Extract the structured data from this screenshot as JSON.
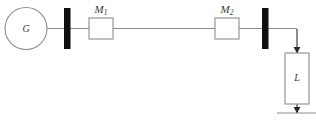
{
  "diagram": {
    "type": "single-line-power-system-schematic",
    "generator": {
      "label": "G",
      "shape": "circle",
      "cx": 26,
      "cy": 28.5,
      "r": 21
    },
    "busbars": [
      {
        "name": "bus-1",
        "x": 64,
        "y": 8,
        "width": 6.5,
        "height": 41
      },
      {
        "name": "bus-2",
        "x": 262,
        "y": 8,
        "width": 6.5,
        "height": 41
      }
    ],
    "machines": [
      {
        "label": "M",
        "subscript": "1",
        "label_full": "M1",
        "x": 89,
        "y": 18,
        "width": 24,
        "height": 21
      },
      {
        "label": "M",
        "subscript": "2",
        "label_full": "M2",
        "x": 215,
        "y": 18,
        "width": 24,
        "height": 21
      }
    ],
    "load": {
      "label": "L",
      "x": 285,
      "y": 53,
      "width": 24,
      "height": 51
    },
    "ground": {
      "name": "ground-symbol",
      "x1": 277,
      "x2": 316,
      "y": 113
    },
    "main_line_y": 28.5,
    "colors": {
      "wire": "#8d8d8d",
      "busbar": "#101010",
      "text": "#3a3a3a",
      "background": "#ffffff"
    }
  }
}
